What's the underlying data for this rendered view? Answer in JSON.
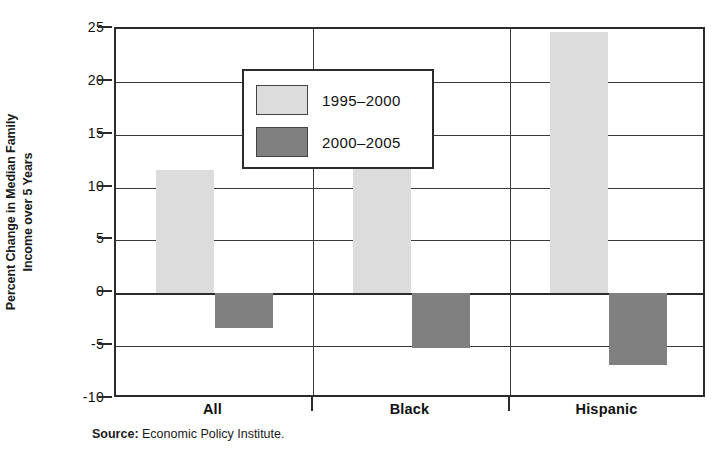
{
  "chart_data": {
    "type": "bar",
    "title": "",
    "subtitle": "",
    "xlabel": "",
    "ylabel_line1": "Percent Change in Median Family",
    "ylabel_line2": "Income over 5 Years",
    "ylabel": "Percent Change in Median Family Income over 5 Years",
    "categories": [
      "All",
      "Black",
      "Hispanic"
    ],
    "series": [
      {
        "name": "1995–2000",
        "color": "#dcdcdc",
        "values": [
          11.7,
          15.4,
          24.7
        ]
      },
      {
        "name": "2000–2005",
        "color": "#808080",
        "values": [
          -3.3,
          -5.2,
          -6.8
        ]
      }
    ],
    "ylim": [
      -10,
      25
    ],
    "yticks": [
      25,
      20,
      15,
      10,
      5,
      0,
      -5,
      -10
    ],
    "ytick_labels": [
      "25",
      "20",
      "15",
      "10",
      "5",
      "0",
      "-5",
      "-10"
    ],
    "grid": true,
    "grid_axis": "y",
    "legend_position": "upper-left-inside",
    "zero_line": 0
  },
  "legend": {
    "items": [
      {
        "label": "1995–2000",
        "swatch": "light"
      },
      {
        "label": "2000–2005",
        "swatch": "dark"
      }
    ]
  },
  "source": {
    "key": "Source:",
    "value": "Economic Policy Institute."
  },
  "colors": {
    "series_1995_2000": "#dcdcdc",
    "series_2000_2005": "#808080",
    "axis": "#2b2b2b",
    "grid": "#3a3a3a",
    "text": "#111111",
    "background": "#ffffff"
  }
}
